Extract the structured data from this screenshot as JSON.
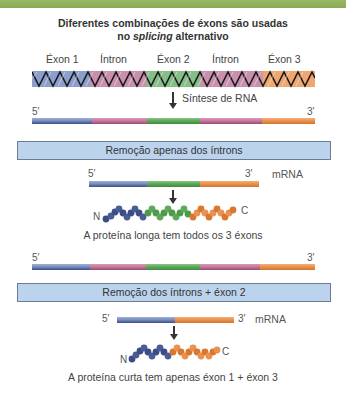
{
  "header": {
    "title_line1": "Diferentes combinações de éxons são usadas",
    "title_line2_prefix": "no ",
    "title_line2_italic": "splicing",
    "title_line2_suffix": " alternativo"
  },
  "gene": {
    "segments": [
      {
        "label": "Éxon 1",
        "type": "exon",
        "color": "#7a8fc0"
      },
      {
        "label": "Íntron",
        "type": "intron",
        "color": "#c77b9f"
      },
      {
        "label": "Éxon 2",
        "type": "exon",
        "color": "#5ea95a"
      },
      {
        "label": "Íntron",
        "type": "intron",
        "color": "#c77b9f"
      },
      {
        "label": "Éxon 3",
        "type": "exon",
        "color": "#ea9150"
      }
    ]
  },
  "synthesis": {
    "label": "Síntese de RNA"
  },
  "pre_mrna_1": {
    "five_prime": "5′",
    "three_prime": "3′"
  },
  "pathway_1": {
    "box_label": "Remoção apenas dos íntrons",
    "mrna_five": "5′",
    "mrna_three": "3′",
    "mrna_label": "mRNA",
    "protein_n": "N",
    "protein_c": "C",
    "caption": "A proteína longa tem todos os 3 éxons"
  },
  "pre_mrna_2": {
    "five_prime": "5′",
    "three_prime": "3′"
  },
  "pathway_2": {
    "box_label": "Remoção dos íntrons + éxon 2",
    "mrna_five": "5′",
    "mrna_three": "3′",
    "mrna_label": "mRNA",
    "protein_n": "N",
    "protein_c": "C",
    "caption": "A proteína curta tem apenas éxon 1 + éxon 3"
  },
  "colors": {
    "exon1": "#3c4d86",
    "intron": "#c77b9f",
    "exon2": "#5ea95a",
    "exon3": "#ea9150",
    "box_fill": "#bcd3ee",
    "top_band": "#8aab55"
  }
}
